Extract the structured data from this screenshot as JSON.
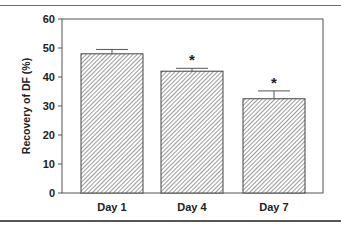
{
  "chart_data": {
    "type": "bar",
    "title": "",
    "xlabel": "",
    "ylabel": "Recovery of DF (%)",
    "categories": [
      "Day 1",
      "Day 4",
      "Day 7"
    ],
    "values": [
      48,
      42,
      32.5
    ],
    "error_bars": [
      1.5,
      1.0,
      2.7
    ],
    "annotations": [
      "",
      "*",
      "*"
    ],
    "ylim": [
      0,
      60
    ],
    "yticks": [
      0,
      10,
      20,
      30,
      40,
      50,
      60
    ],
    "grid": false,
    "legend": null,
    "bar_fill": "diagonal-hatch",
    "colors": {
      "axis": "#555555",
      "bar_stroke": "#444444",
      "hatch": "#555555",
      "text": "#222222"
    }
  }
}
